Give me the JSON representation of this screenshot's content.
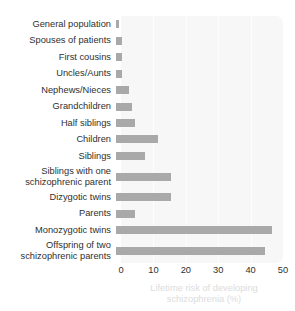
{
  "chart_data": {
    "type": "bar",
    "orientation": "horizontal",
    "title": "",
    "xlabel": "Lifetime risk of developing schizophrenia (%)",
    "ylabel": "",
    "xlim": [
      0,
      50
    ],
    "xticks": [
      "0",
      "10",
      "20",
      "30",
      "40",
      "50"
    ],
    "grid": true,
    "legend": false,
    "bar_color": "#a9a9a9",
    "panel_color": "#f7f7f7",
    "caption_color": "#dcdcdc",
    "categories": [
      "General population",
      "Spouses of patients",
      "First cousins",
      "Uncles/Aunts",
      "Nephews/Nieces",
      "Grandchildren",
      "Half siblings",
      "Children",
      "Siblings",
      "Siblings with one\nschizophrenic parent",
      "Dizygotic twins",
      "Parents",
      "Monozygotic twins",
      "Offspring of two\nschizophrenic parents"
    ],
    "values": [
      1,
      2,
      2,
      2,
      4,
      5,
      6,
      13,
      9,
      17,
      17,
      6,
      48,
      46
    ]
  },
  "axis": {
    "caption": "Lifetime risk of developing\nschizophrenia (%)"
  }
}
